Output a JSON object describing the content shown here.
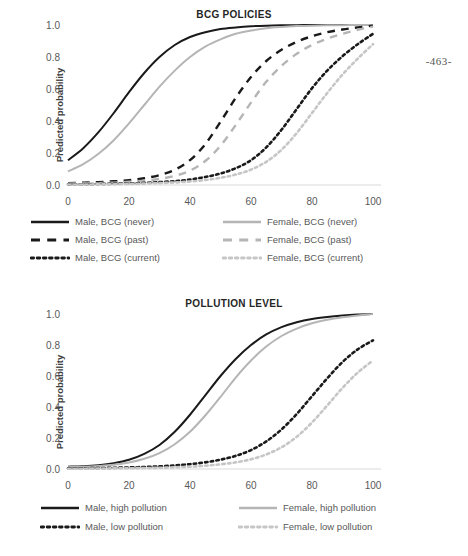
{
  "page_number": "-463-",
  "figures": [
    {
      "id": "bcg",
      "title": "BCG POLICIES",
      "ylabel": "Predicted probability",
      "yticks": [
        "0.0",
        "0.2",
        "0.4",
        "0.6",
        "0.8",
        "1.0"
      ],
      "xticks": [
        "0",
        "20",
        "40",
        "60",
        "80",
        "100"
      ],
      "legend": [
        {
          "label": "Male, BCG (never)",
          "style": "solid",
          "color": "#1a1a1a"
        },
        {
          "label": "Male, BCG (past)",
          "style": "dashed",
          "color": "#1a1a1a"
        },
        {
          "label": "Male, BCG (current)",
          "style": "dotted",
          "color": "#1a1a1a"
        },
        {
          "label": "Female, BCG (never)",
          "style": "solid",
          "color": "#b5b5b5"
        },
        {
          "label": "Female, BCG (past)",
          "style": "dashed",
          "color": "#b5b5b5"
        },
        {
          "label": "Female, BCG (current)",
          "style": "dotted",
          "color": "#c6c6c6"
        }
      ]
    },
    {
      "id": "pollution",
      "title": "POLLUTION LEVEL",
      "ylabel": "Predicted probability",
      "yticks": [
        "0.0",
        "0.2",
        "0.4",
        "0.6",
        "0.8",
        "1.0"
      ],
      "xticks": [
        "0",
        "20",
        "40",
        "60",
        "80",
        "100"
      ],
      "legend": [
        {
          "label": "Male, high pollution",
          "style": "solid",
          "color": "#1a1a1a"
        },
        {
          "label": "Male, low pollution",
          "style": "dotted",
          "color": "#1a1a1a"
        },
        {
          "label": "Female, high pollution",
          "style": "solid",
          "color": "#b5b5b5"
        },
        {
          "label": "Female, low pollution",
          "style": "dotted",
          "color": "#c6c6c6"
        }
      ]
    }
  ],
  "chart_data": [
    {
      "type": "line",
      "title": "BCG POLICIES",
      "xlabel": "",
      "ylabel": "Predicted probability",
      "xlim": [
        0,
        100
      ],
      "ylim": [
        0.0,
        1.0
      ],
      "grid": false,
      "legend_position": "bottom",
      "x": [
        0,
        5,
        10,
        15,
        20,
        25,
        30,
        35,
        40,
        45,
        50,
        55,
        60,
        65,
        70,
        75,
        80,
        85,
        90,
        95,
        100
      ],
      "series": [
        {
          "name": "Male, BCG (never)",
          "style": "solid",
          "color": "#1a1a1a",
          "values": [
            0.155,
            0.23,
            0.33,
            0.45,
            0.58,
            0.7,
            0.8,
            0.875,
            0.925,
            0.955,
            0.975,
            0.985,
            0.992,
            0.996,
            0.998,
            0.999,
            1.0,
            1.0,
            1.0,
            1.0,
            1.0
          ]
        },
        {
          "name": "Female, BCG (never)",
          "style": "solid",
          "color": "#b5b5b5",
          "values": [
            0.085,
            0.13,
            0.195,
            0.28,
            0.385,
            0.5,
            0.615,
            0.715,
            0.8,
            0.865,
            0.91,
            0.945,
            0.965,
            0.98,
            0.988,
            0.993,
            0.996,
            0.998,
            0.999,
            1.0,
            1.0
          ]
        },
        {
          "name": "Male, BCG (past)",
          "style": "dashed",
          "color": "#1a1a1a",
          "values": [
            0.012,
            0.014,
            0.018,
            0.023,
            0.03,
            0.042,
            0.062,
            0.095,
            0.155,
            0.255,
            0.395,
            0.545,
            0.675,
            0.775,
            0.845,
            0.895,
            0.93,
            0.955,
            0.972,
            0.985,
            0.996
          ]
        },
        {
          "name": "Female, BCG (past)",
          "style": "dashed",
          "color": "#b5b5b5",
          "values": [
            0.008,
            0.01,
            0.012,
            0.015,
            0.02,
            0.027,
            0.038,
            0.057,
            0.09,
            0.15,
            0.245,
            0.375,
            0.515,
            0.645,
            0.745,
            0.82,
            0.875,
            0.915,
            0.945,
            0.97,
            0.99
          ]
        },
        {
          "name": "Male, BCG (current)",
          "style": "dotted",
          "color": "#1a1a1a",
          "values": [
            0.004,
            0.005,
            0.006,
            0.008,
            0.01,
            0.013,
            0.018,
            0.024,
            0.034,
            0.05,
            0.072,
            0.105,
            0.155,
            0.235,
            0.345,
            0.475,
            0.605,
            0.715,
            0.805,
            0.88,
            0.945
          ]
        },
        {
          "name": "Female, BCG (current)",
          "style": "dotted",
          "color": "#c6c6c6",
          "values": [
            0.003,
            0.003,
            0.004,
            0.005,
            0.007,
            0.009,
            0.012,
            0.016,
            0.022,
            0.031,
            0.045,
            0.065,
            0.096,
            0.145,
            0.22,
            0.325,
            0.45,
            0.575,
            0.69,
            0.79,
            0.88
          ]
        }
      ]
    },
    {
      "type": "line",
      "title": "POLLUTION LEVEL",
      "xlabel": "",
      "ylabel": "Predicted probability",
      "xlim": [
        0,
        100
      ],
      "ylim": [
        0.0,
        1.0
      ],
      "grid": false,
      "legend_position": "bottom",
      "x": [
        0,
        5,
        10,
        15,
        20,
        25,
        30,
        35,
        40,
        45,
        50,
        55,
        60,
        65,
        70,
        75,
        80,
        85,
        90,
        95,
        100
      ],
      "series": [
        {
          "name": "Male, high pollution",
          "style": "solid",
          "color": "#1a1a1a",
          "values": [
            0.015,
            0.018,
            0.025,
            0.038,
            0.06,
            0.098,
            0.155,
            0.24,
            0.35,
            0.475,
            0.6,
            0.71,
            0.8,
            0.868,
            0.915,
            0.947,
            0.968,
            0.981,
            0.99,
            0.996,
            1.0
          ]
        },
        {
          "name": "Female, high pollution",
          "style": "solid",
          "color": "#b5b5b5",
          "values": [
            0.012,
            0.014,
            0.019,
            0.027,
            0.042,
            0.066,
            0.103,
            0.16,
            0.24,
            0.345,
            0.465,
            0.59,
            0.7,
            0.79,
            0.858,
            0.906,
            0.94,
            0.963,
            0.979,
            0.991,
            1.0
          ]
        },
        {
          "name": "Male, low pollution",
          "style": "dotted",
          "color": "#1a1a1a",
          "values": [
            0.004,
            0.005,
            0.006,
            0.008,
            0.01,
            0.013,
            0.017,
            0.023,
            0.031,
            0.043,
            0.06,
            0.085,
            0.122,
            0.178,
            0.255,
            0.355,
            0.47,
            0.585,
            0.69,
            0.772,
            0.83
          ]
        },
        {
          "name": "Female, low pollution",
          "style": "dotted",
          "color": "#c6c6c6",
          "values": [
            0.002,
            0.002,
            0.003,
            0.004,
            0.005,
            0.006,
            0.008,
            0.011,
            0.015,
            0.021,
            0.03,
            0.043,
            0.063,
            0.094,
            0.14,
            0.208,
            0.3,
            0.41,
            0.523,
            0.622,
            0.7
          ]
        }
      ]
    }
  ]
}
